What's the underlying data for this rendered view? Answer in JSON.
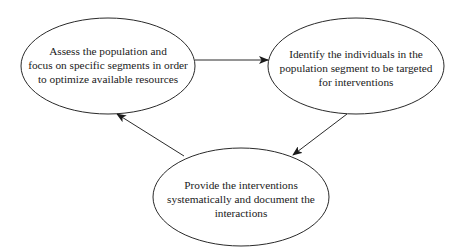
{
  "diagram": {
    "type": "cycle",
    "colors": {
      "stroke": "#2a2a2a",
      "text": "#1a1a1a",
      "background": "#ffffff"
    },
    "nodes": [
      {
        "id": "assess",
        "lines": [
          "Assess the population and",
          "focus on specific segments in order",
          "to optimize available resources"
        ]
      },
      {
        "id": "identify",
        "lines": [
          "Identify the individuals in the",
          "population segment to be targeted",
          "for interventions"
        ]
      },
      {
        "id": "provide",
        "lines": [
          "Provide the interventions",
          "systematically and document the",
          "interactions"
        ]
      }
    ],
    "edges": [
      {
        "from": "assess",
        "to": "identify"
      },
      {
        "from": "identify",
        "to": "provide"
      },
      {
        "from": "provide",
        "to": "assess"
      }
    ]
  }
}
